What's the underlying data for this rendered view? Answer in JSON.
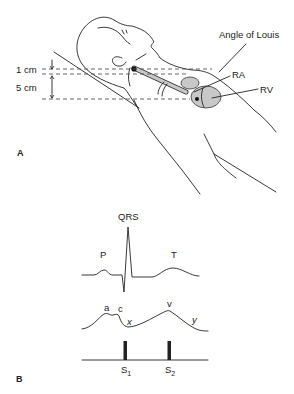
{
  "panel_a": {
    "label": "A",
    "measurements": {
      "upper": "1 cm",
      "lower": "5 cm"
    },
    "annotations": {
      "angle_of_louis": "Angle of Louis",
      "ra": "RA",
      "rv": "RV"
    }
  },
  "panel_b": {
    "label": "B",
    "ecg_labels": {
      "p": "P",
      "qrs": "QRS",
      "t": "T"
    },
    "jvp_labels": {
      "a": "a",
      "c": "c",
      "x": "x",
      "v": "v",
      "y": "y"
    },
    "heart_sounds": {
      "s1_main": "S",
      "s1_sub": "1",
      "s2_main": "S",
      "s2_sub": "2"
    }
  },
  "colors": {
    "line": "#222222",
    "organ_fill": "#c8c8c8",
    "dashed": "#555555"
  }
}
